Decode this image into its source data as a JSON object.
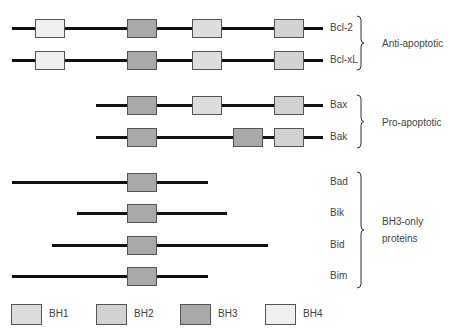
{
  "colors": {
    "BH1": "#dcdcdc",
    "BH2": "#d2d2d2",
    "BH3": "#a9a9a9",
    "BH4": "#efefef",
    "line": "#111111"
  },
  "proteins": [
    {
      "name": "Bcl-2",
      "y": 28,
      "line": [
        12,
        323
      ],
      "domains": [
        {
          "type": "BH4",
          "x": 35
        },
        {
          "type": "BH3",
          "x": 127
        },
        {
          "type": "BH1",
          "x": 192
        },
        {
          "type": "BH2",
          "x": 274
        }
      ]
    },
    {
      "name": "Bcl-xL",
      "y": 60,
      "line": [
        12,
        323
      ],
      "domains": [
        {
          "type": "BH4",
          "x": 35
        },
        {
          "type": "BH3",
          "x": 127
        },
        {
          "type": "BH1",
          "x": 192
        },
        {
          "type": "BH2",
          "x": 274
        }
      ]
    },
    {
      "name": "Bax",
      "y": 105,
      "line": [
        96,
        323
      ],
      "domains": [
        {
          "type": "BH3",
          "x": 127
        },
        {
          "type": "BH1",
          "x": 192
        },
        {
          "type": "BH2",
          "x": 274
        }
      ]
    },
    {
      "name": "Bak",
      "y": 137,
      "line": [
        96,
        323
      ],
      "domains": [
        {
          "type": "BH3",
          "x": 127
        },
        {
          "type": "BH3",
          "x": 233
        },
        {
          "type": "BH2",
          "x": 274
        }
      ]
    },
    {
      "name": "Bad",
      "y": 182,
      "line": [
        12,
        208
      ],
      "domains": [
        {
          "type": "BH3",
          "x": 127
        }
      ]
    },
    {
      "name": "Bik",
      "y": 213,
      "line": [
        77,
        227
      ],
      "domains": [
        {
          "type": "BH3",
          "x": 127
        }
      ]
    },
    {
      "name": "Bid",
      "y": 245,
      "line": [
        52,
        268
      ],
      "domains": [
        {
          "type": "BH3",
          "x": 127
        }
      ]
    },
    {
      "name": "Bim",
      "y": 276,
      "line": [
        12,
        208
      ],
      "domains": [
        {
          "type": "BH3",
          "x": 127
        }
      ]
    }
  ],
  "groups": [
    {
      "label": "Anti-apoptotic",
      "top": 16,
      "bottom": 70
    },
    {
      "label": "Pro-apoptotic",
      "top": 95,
      "bottom": 148
    },
    {
      "label": "BH3-only proteins",
      "label_lines": [
        "BH3-only",
        "proteins"
      ],
      "top": 172,
      "bottom": 288
    }
  ],
  "legend": [
    {
      "label": "BH1",
      "type": "BH1",
      "x": 11
    },
    {
      "label": "BH2",
      "type": "BH2",
      "x": 96
    },
    {
      "label": "BH3",
      "type": "BH3",
      "x": 180
    },
    {
      "label": "BH4",
      "type": "BH4",
      "x": 265
    }
  ]
}
